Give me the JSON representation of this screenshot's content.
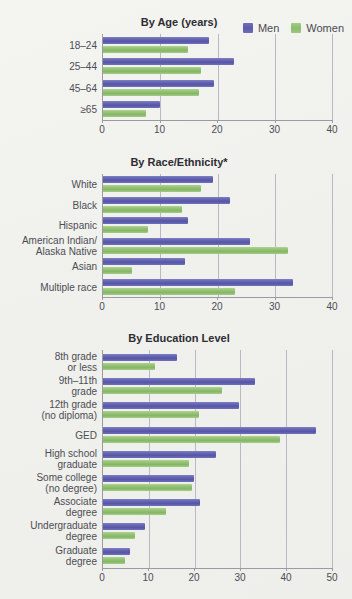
{
  "legend": {
    "entries": [
      {
        "label": "Men",
        "color": "#5c5cab"
      },
      {
        "label": "Women",
        "color": "#8cbc6e"
      }
    ]
  },
  "colors": {
    "men": "#5c5cab",
    "women": "#8cbc6e",
    "background": "#f2f2ee",
    "axis": "#9a9aa4",
    "gridline": "#b9b9c6",
    "text": "#4d4d55",
    "title": "#2d2d33"
  },
  "chart_data": [
    {
      "type": "bar",
      "orientation": "horizontal",
      "title": "By Age (years)",
      "xlabel": "",
      "ylabel": "",
      "xlim": [
        0,
        40
      ],
      "xticks": [
        0,
        10,
        20,
        30,
        40
      ],
      "grid": true,
      "legend_position": "top-right",
      "categories": [
        "18–24",
        "25–44",
        "45–64",
        "≥65"
      ],
      "series": [
        {
          "name": "Men",
          "values": [
            18.5,
            22.9,
            19.4,
            9.9
          ]
        },
        {
          "name": "Women",
          "values": [
            14.8,
            17.1,
            16.8,
            7.5
          ]
        }
      ]
    },
    {
      "type": "bar",
      "orientation": "horizontal",
      "title": "By Race/Ethnicity*",
      "xlabel": "",
      "ylabel": "",
      "xlim": [
        0,
        40
      ],
      "xticks": [
        0,
        10,
        20,
        30,
        40
      ],
      "grid": true,
      "legend_position": "top-right",
      "categories": [
        "White",
        "Black",
        "Hispanic",
        "American Indian/\nAlaska Native",
        "Asian",
        "Multiple race"
      ],
      "series": [
        {
          "name": "Men",
          "values": [
            19.3,
            22.1,
            14.8,
            25.6,
            14.4,
            33.2
          ]
        },
        {
          "name": "Women",
          "values": [
            17.2,
            13.8,
            7.8,
            32.4,
            5.1,
            23.0
          ]
        }
      ]
    },
    {
      "type": "bar",
      "orientation": "horizontal",
      "title": "By Education Level",
      "xlabel": "",
      "ylabel": "",
      "xlim": [
        0,
        50
      ],
      "xticks": [
        0,
        10,
        20,
        30,
        40,
        50
      ],
      "grid": true,
      "legend_position": "top-right",
      "categories": [
        "8th grade\nor less",
        "9th–11th\ngrade",
        "12th grade\n(no diploma)",
        "GED",
        "High school\ngraduate",
        "Some college\n(no degree)",
        "Associate\ndegree",
        "Undergraduate\ndegree",
        "Graduate\ndegree"
      ],
      "series": [
        {
          "name": "Men",
          "values": [
            16.2,
            33.2,
            29.8,
            46.5,
            24.6,
            19.9,
            21.1,
            9.1,
            5.8
          ]
        },
        {
          "name": "Women",
          "values": [
            11.3,
            26.0,
            20.9,
            38.6,
            18.8,
            19.5,
            13.7,
            6.9,
            4.9
          ]
        }
      ]
    }
  ]
}
